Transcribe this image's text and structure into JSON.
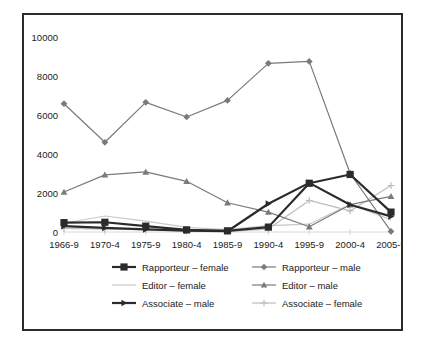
{
  "chart_data": {
    "type": "line",
    "title": "",
    "subtitle": "",
    "xlabel": "",
    "ylabel": "",
    "grid": false,
    "legend_position": "bottom",
    "categories": [
      "1966-9",
      "1970-4",
      "1975-9",
      "1980-4",
      "1985-9",
      "1990-4",
      "1995-9",
      "2000-4",
      "2005-9"
    ],
    "ylim": [
      0,
      10000
    ],
    "ytick_labels": [
      "0",
      "2000",
      "4000",
      "6000",
      "8000",
      "10000"
    ],
    "ytick_values": [
      0,
      2000,
      4000,
      6000,
      8000,
      10000
    ],
    "series": [
      {
        "name": "Rapporteur – female",
        "color": "#2b2b2b",
        "marker": "square",
        "line_width": 2.2,
        "values": [
          480,
          500,
          300,
          110,
          60,
          250,
          2500,
          2950,
          1020
        ]
      },
      {
        "name": "Rapporteur – male",
        "color": "#7a7a7a",
        "marker": "diamond",
        "line_width": 1.2,
        "values": [
          6580,
          4600,
          6650,
          5900,
          6750,
          8650,
          8750,
          3000,
          30
        ]
      },
      {
        "name": "Editor – female",
        "color": "#c9c9c9",
        "marker": "none",
        "line_width": 1.2,
        "values": [
          450,
          820,
          560,
          240,
          120,
          330,
          400,
          1420,
          620
        ]
      },
      {
        "name": "Editor – male",
        "color": "#7a7a7a",
        "marker": "triangle-up",
        "line_width": 1.2,
        "values": [
          2050,
          2930,
          3080,
          2600,
          1500,
          1020,
          270,
          1400,
          1830
        ]
      },
      {
        "name": "Associate – male",
        "color": "#2b2b2b",
        "marker": "triangle-right",
        "line_width": 2.2,
        "values": [
          300,
          210,
          130,
          70,
          40,
          1450,
          2520,
          1400,
          800
        ]
      },
      {
        "name": "Associate – female",
        "color": "#bdbdbd",
        "marker": "plus",
        "line_width": 1.2,
        "values": [
          180,
          150,
          120,
          60,
          30,
          150,
          1620,
          1080,
          2380
        ]
      }
    ],
    "legend_entries": [
      {
        "label": "Rapporteur – female",
        "color": "#2b2b2b",
        "marker": "square"
      },
      {
        "label": "Rapporteur – male",
        "color": "#7a7a7a",
        "marker": "diamond"
      },
      {
        "label": "Editor – female",
        "color": "#c9c9c9",
        "marker": "none"
      },
      {
        "label": "Editor – male",
        "color": "#7a7a7a",
        "marker": "triangle-up"
      },
      {
        "label": "Associate – male",
        "color": "#2b2b2b",
        "marker": "triangle-right"
      },
      {
        "label": "Associate – female",
        "color": "#bdbdbd",
        "marker": "plus"
      }
    ]
  },
  "frame": {
    "border_color": "#2b2b2b",
    "background": "#ffffff"
  }
}
